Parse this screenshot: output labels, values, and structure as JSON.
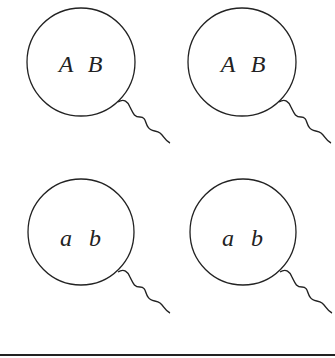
{
  "diagram": {
    "cells": [
      {
        "allele1": "A",
        "allele2": "B"
      },
      {
        "allele1": "A",
        "allele2": "B"
      },
      {
        "allele1": "a",
        "allele2": "b"
      },
      {
        "allele1": "a",
        "allele2": "b"
      }
    ],
    "colors": {
      "stroke": "#222222",
      "background": "#ffffff"
    }
  }
}
